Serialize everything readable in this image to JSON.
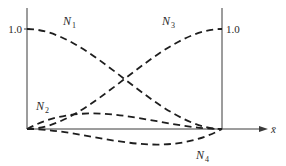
{
  "diagram": {
    "type": "shape-functions",
    "axis": {
      "x_label": "x̄",
      "left_tick_label": "1.0",
      "right_tick_label": "1.0"
    },
    "curves": [
      {
        "id": "N1",
        "label": "N",
        "subscript": "1",
        "description": "starts at 1.0 at left, decays to 0 at right"
      },
      {
        "id": "N2",
        "label": "N",
        "subscript": "2",
        "description": "0 at both ends, positive hump near left third"
      },
      {
        "id": "N3",
        "label": "N",
        "subscript": "3",
        "description": "starts at 0 at left, rises to 1.0 at right"
      },
      {
        "id": "N4",
        "label": "N",
        "subscript": "4",
        "description": "0 at both ends, negative dip near right third"
      }
    ],
    "colors": {
      "ink": "#1e1e1e",
      "background": "#ffffff"
    }
  }
}
